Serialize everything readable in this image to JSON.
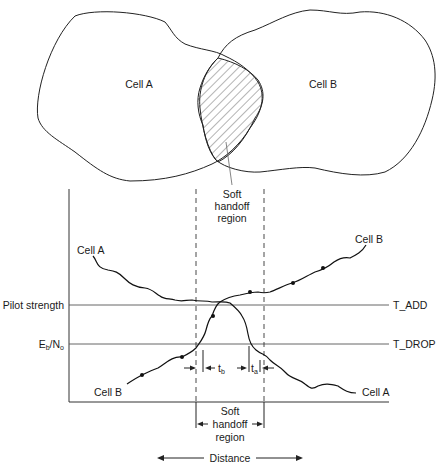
{
  "top_diagram": {
    "cell_a_label": "Cell A",
    "cell_b_label": "Cell B",
    "overlap_label_line1": "Soft",
    "overlap_label_line2": "handoff",
    "overlap_label_line3": "region"
  },
  "graph": {
    "y_labels": {
      "pilot_strength": "Pilot strength",
      "eb_no_main": "E",
      "eb_no_sub_b": "b",
      "eb_no_slash": "/N",
      "eb_no_sub_o": "o"
    },
    "thresholds": {
      "t_add": "T_ADD",
      "t_drop": "T_DROP"
    },
    "curve_labels": {
      "cell_a_left": "Cell A",
      "cell_b_right": "Cell B",
      "cell_b_left": "Cell B",
      "cell_a_right": "Cell A"
    },
    "timers": {
      "t_b_main": "t",
      "t_b_sub": "b",
      "t_a_main": "t",
      "t_a_sub": "a"
    },
    "region_label_line1": "Soft",
    "region_label_line2": "handoff",
    "region_label_line3": "region",
    "x_axis_label": "Distance"
  }
}
